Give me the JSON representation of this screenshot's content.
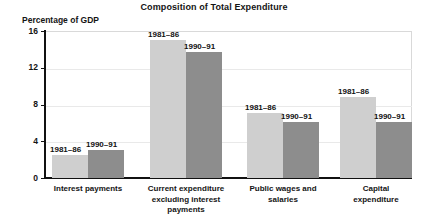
{
  "chart_data": {
    "type": "bar",
    "title": "Composition of Total Expenditure",
    "ylabel": "Percentage of GDP",
    "xlabel": "",
    "ylim": [
      0,
      16
    ],
    "yticks": [
      "0",
      "4",
      "8",
      "12",
      "16"
    ],
    "grid": true,
    "legend_position": "inline-above-bars",
    "categories": [
      "Interest payments",
      "Current expenditure excluding interest payments",
      "Public wages and salaries",
      "Capital expenditure"
    ],
    "series": [
      {
        "name": "1981–86",
        "color": "#cfcfcf",
        "values": [
          2.5,
          15.0,
          7.1,
          8.8
        ]
      },
      {
        "name": "1990–91",
        "color": "#8d8d8d",
        "values": [
          3.0,
          13.7,
          6.1,
          6.1
        ]
      }
    ],
    "bar_labels": [
      [
        "1981–86",
        "1990–91"
      ],
      [
        "1981–86",
        "1990–91"
      ],
      [
        "1981–86",
        "1990–91"
      ],
      [
        "1981–86",
        "1990–91"
      ]
    ],
    "category_label_lines": [
      [
        "Interest payments"
      ],
      [
        "Current expenditure",
        "excluding interest",
        "payments"
      ],
      [
        "Public wages and",
        "salaries"
      ],
      [
        "Capital",
        "expenditure"
      ]
    ]
  }
}
